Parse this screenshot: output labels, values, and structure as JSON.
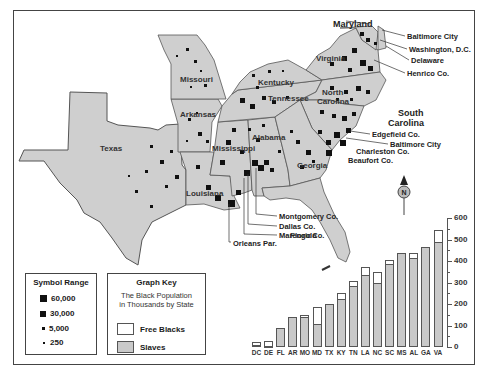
{
  "map": {
    "state_labels": [
      {
        "id": "missouri",
        "text": "Missouri",
        "x": 180,
        "y": 76
      },
      {
        "id": "arkansas",
        "text": "Arkansas",
        "x": 180,
        "y": 111
      },
      {
        "id": "texas",
        "text": "Texas",
        "x": 100,
        "y": 145
      },
      {
        "id": "kentucky",
        "text": "Kentucky",
        "x": 258,
        "y": 79
      },
      {
        "id": "tennessee",
        "text": "Tennessee",
        "x": 268,
        "y": 95
      },
      {
        "id": "virginia",
        "text": "Virginia",
        "x": 316,
        "y": 55
      },
      {
        "id": "north-carolina-1",
        "text": "North",
        "x": 322,
        "y": 89
      },
      {
        "id": "north-carolina-2",
        "text": "Carolina",
        "x": 317,
        "y": 98
      },
      {
        "id": "alabama",
        "text": "Alabama",
        "x": 252,
        "y": 134
      },
      {
        "id": "mississippi",
        "text": "Mississippi",
        "x": 212,
        "y": 145
      },
      {
        "id": "georgia",
        "text": "Georgia",
        "x": 297,
        "y": 162
      },
      {
        "id": "louisiana",
        "text": "Louisiana",
        "x": 186,
        "y": 190
      },
      {
        "id": "florida",
        "text": "Florida",
        "x": 290,
        "y": 232
      }
    ],
    "callouts": [
      {
        "id": "maryland",
        "text": "Maryland",
        "x": 333,
        "y": 20,
        "big": true
      },
      {
        "id": "baltimore-city-md",
        "text": "Baltimore City",
        "x": 407,
        "y": 33
      },
      {
        "id": "washington-dc",
        "text": "Washington, D.C.",
        "x": 409,
        "y": 46
      },
      {
        "id": "delaware",
        "text": "Delaware",
        "x": 411,
        "y": 57
      },
      {
        "id": "henrico-co",
        "text": "Henrico Co.",
        "x": 407,
        "y": 70
      },
      {
        "id": "south-carolina-1",
        "text": "South",
        "x": 398,
        "y": 109,
        "big": true
      },
      {
        "id": "south-carolina-2",
        "text": "Carolina",
        "x": 388,
        "y": 119,
        "big": true
      },
      {
        "id": "edgefield-co",
        "text": "Edgefield Co.",
        "x": 372,
        "y": 131
      },
      {
        "id": "baltimore-city-sc",
        "text": "Baltimore City",
        "x": 390,
        "y": 141
      },
      {
        "id": "charleston-co",
        "text": "Charleston Co.",
        "x": 356,
        "y": 148
      },
      {
        "id": "beaufort-co",
        "text": "Beaufort Co.",
        "x": 348,
        "y": 157
      },
      {
        "id": "montgomery-co",
        "text": "Montgomery Co.",
        "x": 279,
        "y": 213
      },
      {
        "id": "dallas-co",
        "text": "Dallas Co.",
        "x": 279,
        "y": 223
      },
      {
        "id": "marengo-co",
        "text": "Marengo Co.",
        "x": 279,
        "y": 232
      },
      {
        "id": "orleans-par",
        "text": "Orleans Par.",
        "x": 233,
        "y": 240
      }
    ],
    "compass_label": "N"
  },
  "symbol_range": {
    "title": "Symbol Range",
    "items": [
      {
        "label": "60,000",
        "size": 7
      },
      {
        "label": "30,000",
        "size": 6
      },
      {
        "label": "5,000",
        "size": 3
      },
      {
        "label": "250",
        "size": 2
      }
    ]
  },
  "graph_key": {
    "title": "Graph Key",
    "subtitle_1": "The Black Population",
    "subtitle_2": "in Thousands by State",
    "items": [
      {
        "label": "Free Blacks",
        "color": "#ffffff"
      },
      {
        "label": "Slaves",
        "color": "#c9c9c9"
      }
    ]
  },
  "chart_data": {
    "type": "bar",
    "stacked": true,
    "title": "The Black Population in Thousands by State",
    "xlabel": "",
    "ylabel": "Thousands",
    "categories": [
      "DC",
      "DE",
      "FL",
      "AR",
      "MO",
      "MD",
      "TX",
      "KY",
      "TN",
      "LA",
      "NC",
      "SC",
      "MS",
      "AL",
      "GA",
      "VA"
    ],
    "series": [
      {
        "name": "Slaves",
        "color": "#c9c9c9",
        "values": [
          10,
          5,
          90,
          140,
          140,
          105,
          200,
          225,
          285,
          335,
          300,
          385,
          435,
          415,
          465,
          490
        ]
      },
      {
        "name": "Free Blacks",
        "color": "#ffffff",
        "values": [
          15,
          25,
          0,
          0,
          10,
          80,
          0,
          25,
          20,
          35,
          50,
          20,
          0,
          20,
          0,
          55
        ]
      }
    ],
    "yticks": [
      0,
      100,
      200,
      300,
      400,
      500,
      600
    ],
    "ylim": [
      0,
      600
    ],
    "grid": false,
    "yaxis_position": "right",
    "legend_position": "separate-box"
  }
}
